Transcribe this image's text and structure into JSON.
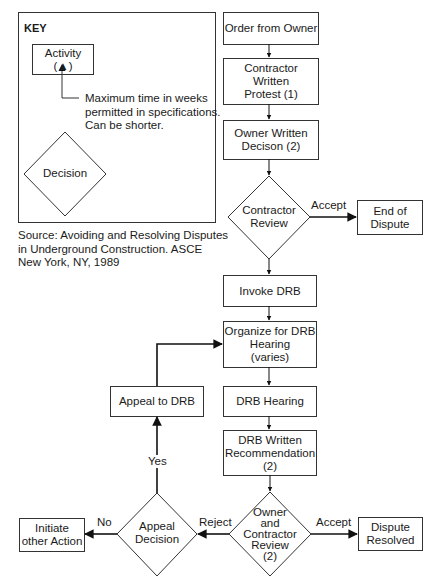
{
  "key": {
    "title": "KEY",
    "activity_label": "Activity",
    "activity_marker": "(▲)",
    "note_lines": [
      "Maximum time in weeks",
      "permitted in specifications.",
      "Can be shorter."
    ],
    "decision_label": "Decision"
  },
  "source": {
    "lines": [
      "Source: Avoiding and Resolving Disputes",
      "in Underground Construction. ASCE",
      "New York, NY, 1989"
    ]
  },
  "nodes": {
    "order_from_owner": "Order from Owner",
    "contractor_written_protest": [
      "Contractor",
      "Written",
      "Protest (1)"
    ],
    "owner_written_decision": [
      "Owner Written",
      "Decison (2)"
    ],
    "contractor_review": [
      "Contractor",
      "Review"
    ],
    "end_of_dispute": [
      "End of",
      "Dispute"
    ],
    "invoke_drb": "Invoke DRB",
    "organize_drb_hearing": [
      "Organize for DRB",
      "Hearing",
      "(varies)"
    ],
    "drb_hearing": "DRB Hearing",
    "drb_written_recommendation": [
      "DRB Written",
      "Recommendation",
      "(2)"
    ],
    "owner_contractor_review": [
      "Owner",
      "and",
      "Contractor",
      "Review",
      "(2)"
    ],
    "dispute_resolved": [
      "Dispute",
      "Resolved"
    ],
    "appeal_decision": [
      "Appeal",
      "Decision"
    ],
    "initiate_other_action": [
      "Initiate",
      "other Action"
    ],
    "appeal_to_drb": "Appeal to DRB"
  },
  "edges": {
    "accept_1": "Accept",
    "accept_2": "Accept",
    "reject": "Reject",
    "no": "No",
    "yes": "Yes"
  }
}
